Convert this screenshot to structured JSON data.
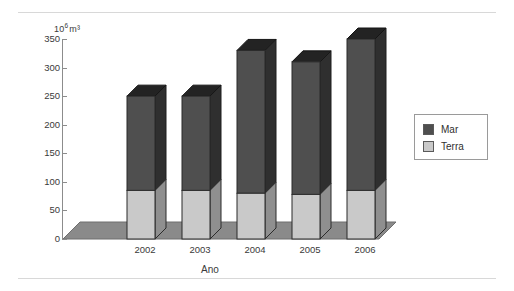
{
  "chart_data": {
    "type": "bar",
    "subtype": "stacked-column-3d",
    "title": "",
    "xlabel": "Ano",
    "ylabel": "10⁶ m³",
    "ylabel_base": "10",
    "ylabel_exponent": "6",
    "ylabel_unit": "m³",
    "categories": [
      "2002",
      "2003",
      "2004",
      "2005",
      "2006"
    ],
    "ylim": [
      0,
      350
    ],
    "yticks": [
      0,
      50,
      100,
      150,
      200,
      250,
      300,
      350
    ],
    "ytick_labels": [
      "0",
      "50",
      "100",
      "150",
      "200",
      "250",
      "300",
      "350"
    ],
    "grid": false,
    "legend_position": "right",
    "series": [
      {
        "name": "Terra",
        "color": "#c9c9c9",
        "values": [
          85,
          85,
          80,
          78,
          85
        ]
      },
      {
        "name": "Mar",
        "color": "#4f4f4f",
        "values": [
          165,
          165,
          250,
          232,
          265
        ]
      }
    ],
    "totals": [
      250,
      250,
      330,
      310,
      350
    ],
    "stack_order": [
      "Terra",
      "Mar"
    ]
  },
  "legend": {
    "entries": [
      {
        "label": "Mar",
        "color": "#4f4f4f"
      },
      {
        "label": "Terra",
        "color": "#c9c9c9"
      }
    ]
  },
  "axes": {
    "y_unit_caption": "10⁶ m³",
    "x_axis_title": "Ano"
  },
  "colors": {
    "mar": "#4f4f4f",
    "terra": "#c9c9c9",
    "floor": "#8a8a8a",
    "outline": "#2b2b2b",
    "axis": "#8c8c8c",
    "rule": "#d8d8d8",
    "text": "#3a3a3a"
  }
}
